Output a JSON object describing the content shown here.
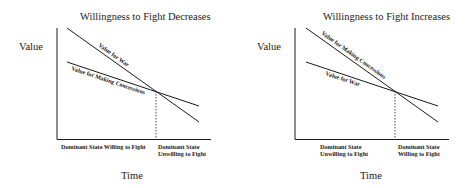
{
  "diagrams": [
    {
      "title": "Willingness to Fight Decreases",
      "y_axis_label": "Value",
      "x_axis_label": "Time",
      "x_categories": [
        "Dominant State Willing to Fight",
        "Dominant State\nUnwilling to Fight"
      ],
      "x_category_lines": [
        [
          "Dominant State Willing to Fight"
        ],
        [
          "Dominant State",
          "Unwilling to Fight"
        ]
      ],
      "lines": [
        {
          "label": "Value for War",
          "slope": "steep"
        },
        {
          "label": "Value for Making Concessions",
          "slope": "shallow"
        }
      ],
      "crossover_marker": "dashed vertical line at intersection"
    },
    {
      "title": "Willingness to Fight Increases",
      "y_axis_label": "Value",
      "x_axis_label": "Time",
      "x_categories": [
        "Dominant State\nUnwilling to Fight",
        "Dominant State\nWilling to Fight"
      ],
      "x_category_lines": [
        [
          "Dominant State",
          "Unwilling to Fight"
        ],
        [
          "Dominant State",
          "Willing to Fight"
        ]
      ],
      "lines": [
        {
          "label": "Value for Making Concessions",
          "slope": "steep"
        },
        {
          "label": "Value for War",
          "slope": "shallow"
        }
      ],
      "crossover_marker": "dashed vertical line at intersection"
    }
  ],
  "colors": {
    "line": "#1a1a1a",
    "background": "#ffffff"
  }
}
